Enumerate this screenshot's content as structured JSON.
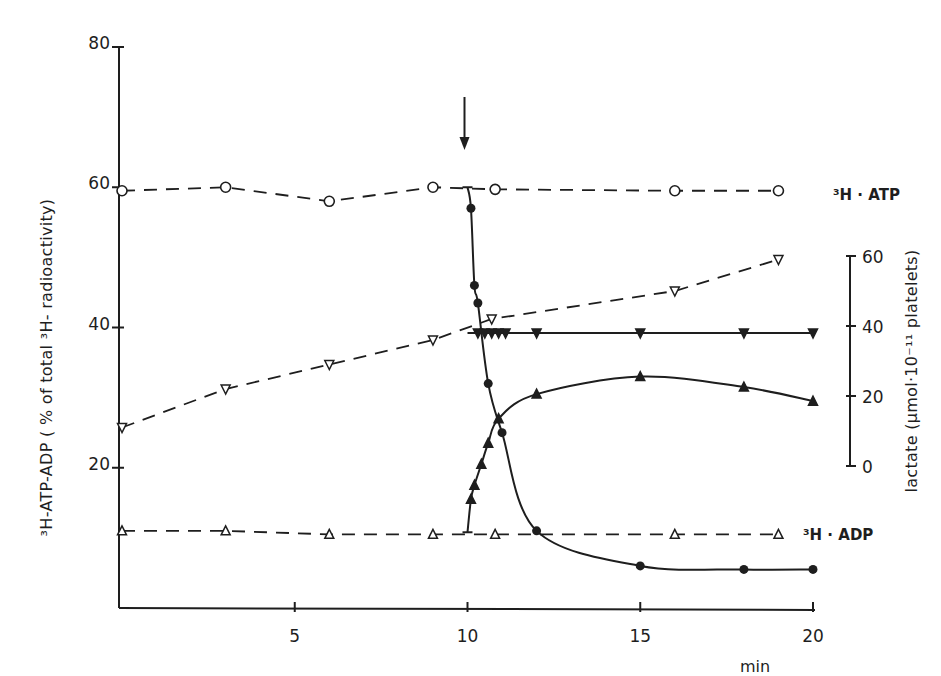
{
  "chart_data": {
    "type": "line",
    "title": "",
    "xlabel": "min",
    "ylabel": "3H-ATP-ADP ( % of total 3H-radioactivity)",
    "ylabel_right": "lactate (µmol·10⁻¹¹ platelets)",
    "xlim": [
      0,
      20
    ],
    "ylim": [
      0,
      80
    ],
    "ylim_right": [
      0,
      60
    ],
    "x_ticks": [
      5,
      10,
      15,
      20
    ],
    "y_ticks": [
      20,
      40,
      60,
      80
    ],
    "y_ticks_right": [
      0,
      20,
      40,
      60
    ],
    "grid": false,
    "legend": "inline labels at right end of lines",
    "annotations": [
      {
        "type": "arrow",
        "x": 10,
        "text": "",
        "meaning": "addition point at 10 min"
      },
      {
        "type": "label",
        "text": "3H · ATP",
        "series": "3H-ATP (control)"
      },
      {
        "type": "label",
        "text": "3H · ADP",
        "series": "3H-ADP (control)"
      }
    ],
    "series": [
      {
        "name": "3H-ATP control (open circles, dashed)",
        "axis": "left",
        "marker": "open-circle",
        "line": "dashed",
        "x": [
          0,
          3,
          6,
          9,
          10.8,
          16,
          19
        ],
        "y": [
          59.5,
          60,
          58,
          60,
          59.7,
          59.5,
          59.5
        ]
      },
      {
        "name": "3H-ATP after addition (filled circles, solid)",
        "axis": "left",
        "marker": "filled-circle",
        "line": "solid",
        "x": [
          10,
          10.1,
          10.2,
          10.3,
          10.6,
          11,
          12,
          15,
          18,
          20
        ],
        "y": [
          60,
          57,
          46,
          43.5,
          32,
          25,
          11,
          6,
          5.5,
          5.5
        ]
      },
      {
        "name": "3H-ADP control (open triangles, dashed)",
        "axis": "left",
        "marker": "open-triangle-up",
        "line": "dashed",
        "x": [
          0,
          3,
          6,
          9,
          10.8,
          16,
          19
        ],
        "y": [
          11,
          11,
          10.5,
          10.5,
          10.5,
          10.5,
          10.5
        ]
      },
      {
        "name": "3H-ADP after addition (filled triangles, solid)",
        "axis": "left",
        "marker": "filled-triangle-up",
        "line": "solid",
        "x": [
          10,
          10.1,
          10.2,
          10.4,
          10.6,
          10.9,
          12,
          15,
          18,
          20
        ],
        "y": [
          10.8,
          15.5,
          17.5,
          20.5,
          23.5,
          27,
          30.5,
          33,
          31.5,
          29.5
        ]
      },
      {
        "name": "lactate control (open inverted triangles, dashed)",
        "axis": "right",
        "marker": "open-triangle-down",
        "line": "dashed",
        "x": [
          0,
          3,
          6,
          9,
          10.7,
          16,
          19
        ],
        "y": [
          11,
          22,
          29,
          36,
          42,
          50,
          59
        ]
      },
      {
        "name": "lactate after addition (filled inverted triangles, solid)",
        "axis": "right",
        "marker": "filled-triangle-down",
        "line": "solid",
        "x": [
          10,
          10.3,
          10.5,
          10.7,
          10.9,
          11.1,
          12,
          15,
          18,
          20
        ],
        "y": [
          38,
          38,
          38,
          38,
          38,
          38,
          38,
          38,
          38,
          38
        ]
      }
    ]
  },
  "labels": {
    "y_left_title": "³H-ATP-ADP ( % of total ³H- radioactivity)",
    "y_right_title": "lactate (µmol·10⁻¹¹ platelets)",
    "x_unit": "min",
    "atp_label": "³H · ATP",
    "adp_label": "³H · ADP",
    "x_ticks": [
      "5",
      "10",
      "15",
      "20"
    ],
    "y_left_ticks": [
      "20",
      "40",
      "60",
      "80"
    ],
    "y_right_ticks": [
      "0",
      "20",
      "40",
      "60"
    ]
  }
}
